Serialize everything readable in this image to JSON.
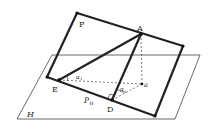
{
  "diagram": {
    "type": "geometry-projection",
    "colors": {
      "line": "#222222",
      "plane": "#444444",
      "background": "#ffffff"
    },
    "labels": {
      "plane_p": "P",
      "plane_h": "H",
      "point_a": "A",
      "point_e": "E",
      "point_d": "D",
      "point_a_proj": "a",
      "trace_ph": "P",
      "trace_ph_sub": "H",
      "angle_alpha": "α",
      "angle_alpha_sub": "1",
      "angle_theta": "α"
    },
    "points": {
      "P_corner_tl": [
        77,
        13
      ],
      "P_corner_tr": [
        183,
        46
      ],
      "P_corner_br": [
        155,
        116
      ],
      "P_corner_bl": [
        47,
        77
      ],
      "A": [
        141,
        34
      ],
      "E": [
        59,
        80
      ],
      "D": [
        112,
        100
      ],
      "a": [
        142,
        84
      ]
    }
  }
}
